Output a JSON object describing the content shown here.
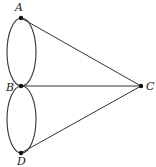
{
  "diagram": {
    "type": "graph",
    "nodes": [
      {
        "id": "A",
        "label": "A",
        "x": 21,
        "y": 18
      },
      {
        "id": "B",
        "label": "B",
        "x": 21,
        "y": 86
      },
      {
        "id": "C",
        "label": "C",
        "x": 141,
        "y": 86
      },
      {
        "id": "D",
        "label": "D",
        "x": 21,
        "y": 153
      }
    ],
    "edges": [
      {
        "from": "A",
        "to": "B",
        "count": 2,
        "style": "curved"
      },
      {
        "from": "B",
        "to": "D",
        "count": 2,
        "style": "curved"
      },
      {
        "from": "A",
        "to": "C",
        "count": 1,
        "style": "straight"
      },
      {
        "from": "B",
        "to": "C",
        "count": 1,
        "style": "straight"
      },
      {
        "from": "D",
        "to": "C",
        "count": 1,
        "style": "straight"
      }
    ],
    "colors": {
      "stroke": "#333333",
      "node": "#111111",
      "background": "#ffffff"
    }
  }
}
